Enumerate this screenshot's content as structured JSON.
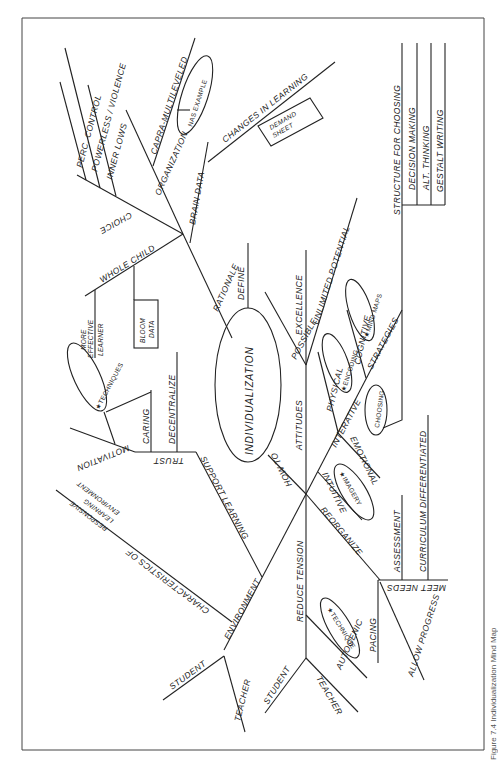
{
  "figure": {
    "caption": "Figure 7.4 Individualization Mind Map",
    "center": "INDIVIDUALIZATION"
  },
  "branches": {
    "rationale": {
      "label": "RATIONALE",
      "brain_data": "BRAIN DATA",
      "changes_in_learning": "CHANGES IN LEARNING",
      "demand_sheet": [
        "DEMAND",
        "SHEET"
      ],
      "organization": "ORGANIZATION",
      "capra": "CAPRA-MULTILEVELED",
      "nas_example": "NAS EXAMPLE",
      "choice": "CHOICE",
      "perc_control": "PERC. CONTROL",
      "powerless_violence": "POWERLESS / VIOLENCE",
      "powerless": "POWERLESS",
      "inner_lows": "INNER LOWS",
      "whole_child": "WHOLE CHILD",
      "more_effective_learner": [
        "MORE",
        "EFFECTIVE",
        "LEARNER"
      ],
      "bloom_data": [
        "BLOOM",
        "DATA"
      ]
    },
    "define": {
      "label": "DEFINE"
    },
    "how_to": {
      "label": "HOW TO",
      "attitudes": "ATTITUDES",
      "possible": "POSSIBLE",
      "excellence": "EXCELLENCE",
      "unlimited_potential": "UNLIMITED POTENTIAL",
      "strategies": "STRATEGIES",
      "structure_for_choosing": "STRUCTURE FOR CHOOSING",
      "decision_making": "DECISION MAKING",
      "alt_thinking": "ALT. THINKING",
      "gestalt_writing": "GESTALT WRITING",
      "cognitive": "COGNITIVE",
      "mind_maps": "★MIND MAPS",
      "physical": "PHYSICAL",
      "encoding": "★ENCODING",
      "interative": "INTERATIVE",
      "emotional": "EMOTIONAL",
      "choosing": "CHOOSING",
      "intuitive": "INTUITIVE",
      "imagery": "★IMAGERY",
      "reorganize": "REORGANIZE",
      "meet_needs": "MEET NEEDS",
      "assessment": "ASSESSMENT",
      "curriculum_differentiated": "CURRICULUM DIFFERENTIATED",
      "pacing": "PACING",
      "allow_progress": "ALLOW PROGRESS",
      "reduce_tension": "REDUCE TENSION",
      "autogenic": "AUTOGENIC",
      "technique": "★TECHNIQUE",
      "student": "STUDENT",
      "teacher": "TEACHER"
    },
    "environment": {
      "label": "ENVIRONMENT",
      "support_learning": "SUPPORT LEARNING",
      "trust": "TRUST",
      "caring": "CARING",
      "decentralize": "DECENTRALIZE",
      "motivation": "MOTIVATION",
      "techniques": "★TECHNIQUES",
      "characteristics": "CHARACTERISTICS OF",
      "responsive": [
        "RESPONSIVE",
        "LEARNING",
        "ENVIRONMENT"
      ],
      "student": "STUDENT",
      "teacher": "TEACHER"
    }
  }
}
